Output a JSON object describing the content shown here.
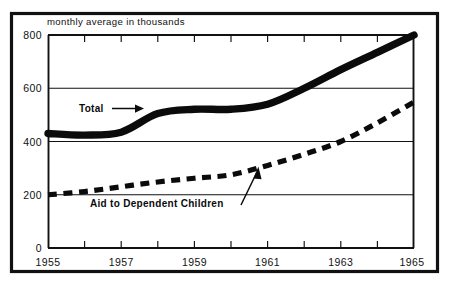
{
  "chart_data": {
    "type": "line",
    "title": "monthly average in thousands",
    "xlabel": "",
    "ylabel": "",
    "xlim": [
      1955,
      1965
    ],
    "ylim": [
      0,
      800
    ],
    "grid": true,
    "legend_position": "inline-annotations",
    "y_ticks": [
      "0",
      "200",
      "400",
      "600",
      "800"
    ],
    "y_tick_values": [
      0,
      200,
      400,
      600,
      800
    ],
    "x_ticks": [
      "1955",
      "1957",
      "1959",
      "1961",
      "1963",
      "1965"
    ],
    "x_tick_values": [
      1955,
      1957,
      1959,
      1961,
      1963,
      1965
    ],
    "x_minor_tick_values": [
      1956,
      1958,
      1960,
      1962,
      1964
    ],
    "x": [
      1955,
      1956,
      1957,
      1958,
      1959,
      1960,
      1961,
      1962,
      1963,
      1964,
      1965
    ],
    "series": [
      {
        "name": "Total",
        "style": "thick-solid",
        "values": [
          430,
          424,
          435,
          505,
          521,
          521,
          540,
          600,
          670,
          735,
          800
        ]
      },
      {
        "name": "Aid to Dependent Children",
        "style": "thick-dashed",
        "values": [
          200,
          212,
          230,
          248,
          262,
          275,
          310,
          352,
          400,
          470,
          548
        ]
      }
    ],
    "annotations": [
      {
        "text": "Total",
        "target_series": "Total",
        "arrow_direction": "right"
      },
      {
        "text": "Aid to Dependent Children",
        "target_series": "Aid to Dependent Children",
        "arrow_direction": "up-right"
      }
    ],
    "colors": {
      "line": "#0b0b0b",
      "axis": "#111111",
      "background": "#ffffff"
    }
  }
}
